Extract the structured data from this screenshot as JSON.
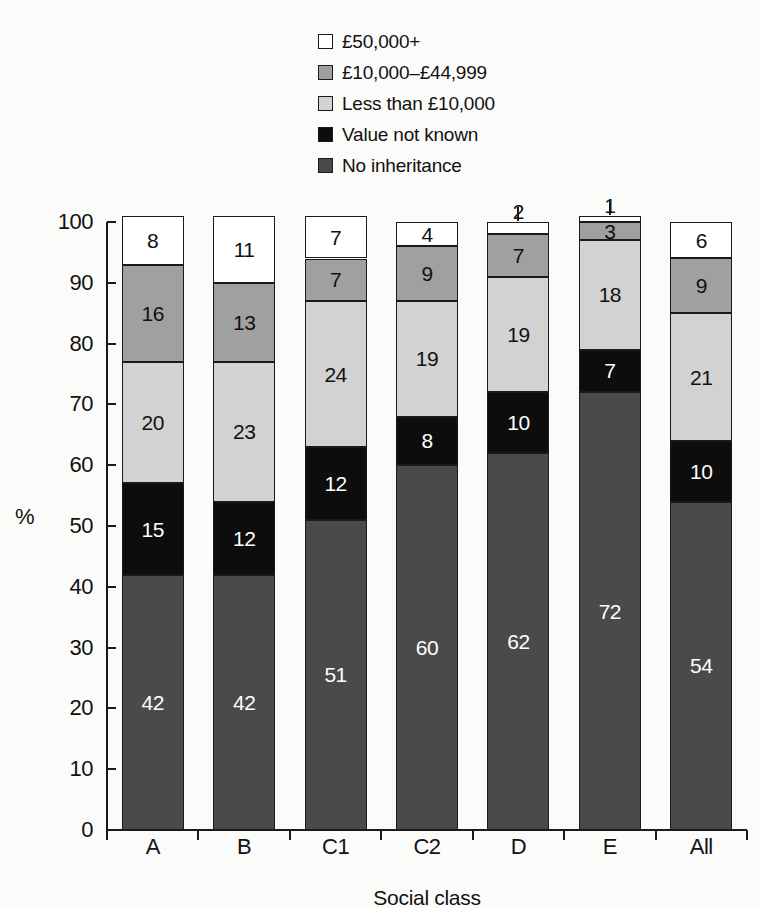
{
  "chart_data": {
    "type": "bar",
    "stacked": true,
    "title": "",
    "xlabel": "Social class",
    "ylabel": "%",
    "ylim": [
      0,
      100
    ],
    "ytick_labels": [
      "100",
      "90",
      "80",
      "70",
      "60",
      "50",
      "40",
      "30",
      "20",
      "10",
      "0"
    ],
    "ytick_values": [
      100,
      90,
      80,
      70,
      60,
      50,
      40,
      30,
      20,
      10,
      0
    ],
    "grid": false,
    "legend_position": "top",
    "categories": [
      "A",
      "B",
      "C1",
      "C2",
      "D",
      "E",
      "All"
    ],
    "series": [
      {
        "name": "No inheritance",
        "color": "#4a4a4a",
        "text_color": "#ffffff",
        "values": [
          42,
          42,
          51,
          60,
          62,
          72,
          54
        ]
      },
      {
        "name": "Value not known",
        "color": "#0d0d0d",
        "text_color": "#ffffff",
        "values": [
          15,
          12,
          12,
          8,
          10,
          7,
          10
        ]
      },
      {
        "name": "Less than £10,000",
        "color": "#d2d2d2",
        "text_color": "#111111",
        "values": [
          20,
          23,
          24,
          19,
          19,
          18,
          21
        ]
      },
      {
        "name": "£10,000–£44,999",
        "color": "#a0a0a0",
        "text_color": "#111111",
        "values": [
          16,
          13,
          7,
          9,
          7,
          3,
          9
        ]
      },
      {
        "name": "£50,000+",
        "color": "#ffffff",
        "text_color": "#111111",
        "values": [
          8,
          11,
          7,
          4,
          2,
          1,
          6
        ]
      }
    ],
    "legend": [
      {
        "label": "£50,000+",
        "color": "#ffffff"
      },
      {
        "label": "£10,000–£44,999",
        "color": "#a0a0a0"
      },
      {
        "label": "Less than £10,000",
        "color": "#d2d2d2"
      },
      {
        "label": "Value not known",
        "color": "#0d0d0d"
      },
      {
        "label": "No inheritance",
        "color": "#4a4a4a"
      }
    ]
  }
}
